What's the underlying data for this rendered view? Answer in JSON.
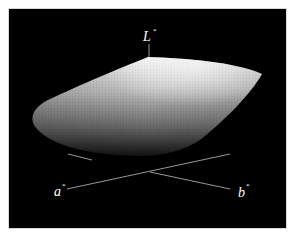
{
  "figure": {
    "background_color": "#000000",
    "surface_color_light": "#f2f2f2",
    "surface_color_dark": "#1a1a1a",
    "axis_color": "#bfbfbf"
  },
  "axes": {
    "L": {
      "label": "L",
      "superscript": "*"
    },
    "a": {
      "label": "a",
      "superscript": "*"
    },
    "b": {
      "label": "b",
      "superscript": "*"
    }
  }
}
